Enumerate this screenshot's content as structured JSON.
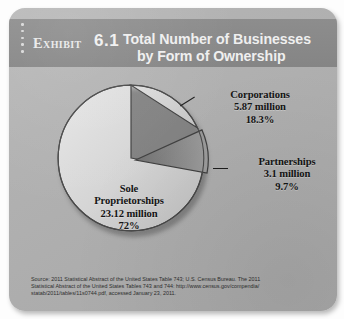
{
  "exhibit": {
    "label": "Exhibit",
    "number": "6.1",
    "title_line1": "Total Number of Businesses",
    "title_line2": "by Form of Ownership",
    "dot_count": 5
  },
  "labels": {
    "corporations": {
      "name": "Corporations",
      "value": "5.87 million",
      "percent": "18.3%"
    },
    "partnerships": {
      "name": "Partnerships",
      "value": "3.1 million",
      "percent": "9.7%"
    },
    "sole": {
      "name_line1": "Sole",
      "name_line2": "Proprietorships",
      "value": "23.12 million",
      "percent": "72%"
    }
  },
  "source": {
    "line1": "Source: 2011 Statistical Abstract of the United States Table 743; U.S. Census Bureau. The 2011",
    "line2": "Statistical Abstract of the United States Tables 743 and 744: http://www.census.gov/compendia/",
    "line3": "statab/2011/tables/11s0744.pdf, accessed January 23, 2011."
  },
  "colors": {
    "card_bg": "#b2b2b2",
    "header_bg": "#898989",
    "header_text": "#efefef",
    "label_text": "#141414",
    "wedge_corporations": "#d2d2d2",
    "wedge_partnerships": "#8a8a8a",
    "wedge_sole": "#d9d9d9",
    "wedge_edge": "#3a3a3a"
  },
  "chart_data": {
    "type": "pie",
    "title": "Total Number of Businesses by Form of Ownership",
    "subtitle": "Exhibit 6.1",
    "unit": "millions of businesses",
    "start_angle_deg": 0,
    "direction": "clockwise",
    "legend": "none (direct labels with leader lines)",
    "categories": [
      "Corporations",
      "Partnerships",
      "Sole Proprietorships"
    ],
    "values": [
      5.87,
      3.1,
      23.12
    ],
    "percents": [
      18.3,
      9.7,
      72.0
    ],
    "slices": [
      {
        "label": "Corporations",
        "value": 5.87,
        "value_text": "5.87 million",
        "percent": 18.3,
        "percent_text": "18.3%",
        "exploded": false,
        "color": "#d2d2d2"
      },
      {
        "label": "Partnerships",
        "value": 3.1,
        "value_text": "3.1 million",
        "percent": 9.7,
        "percent_text": "9.7%",
        "exploded": true,
        "color": "#8a8a8a"
      },
      {
        "label": "Sole Proprietorships",
        "value": 23.12,
        "value_text": "23.12 million",
        "percent": 72.0,
        "percent_text": "72%",
        "exploded": false,
        "color": "#d9d9d9"
      }
    ]
  }
}
